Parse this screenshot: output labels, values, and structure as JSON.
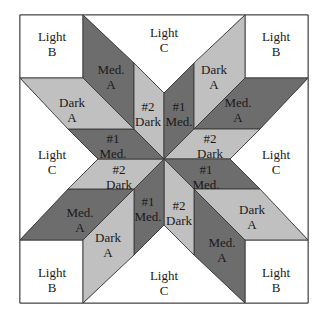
{
  "colors": {
    "light": "#ffffff",
    "medium": "#6d6d6d",
    "dark": "#c0c0c0",
    "outline": "#3a3a3a",
    "text": "#1a1a1a"
  },
  "corners": [
    {
      "id": "corner-top-left",
      "line1": "Light",
      "line2": "B"
    },
    {
      "id": "corner-top-right",
      "line1": "Light",
      "line2": "B"
    },
    {
      "id": "corner-bottom-left",
      "line1": "Light",
      "line2": "B"
    },
    {
      "id": "corner-bottom-right",
      "line1": "Light",
      "line2": "B"
    }
  ],
  "triangles": [
    {
      "id": "triangle-top",
      "line1": "Light",
      "line2": "C"
    },
    {
      "id": "triangle-right",
      "line1": "Light",
      "line2": "C"
    },
    {
      "id": "triangle-bottom",
      "line1": "Light",
      "line2": "C"
    },
    {
      "id": "triangle-left",
      "line1": "Light",
      "line2": "C"
    }
  ],
  "pieces": [
    {
      "id": "outer-top-left",
      "tone": "medium",
      "line1": "Med.",
      "line2": "A"
    },
    {
      "id": "inner-top-left",
      "tone": "dark",
      "line1": "#2",
      "line2": "Dark"
    },
    {
      "id": "inner-top-right",
      "tone": "medium",
      "line1": "#1",
      "line2": "Med."
    },
    {
      "id": "outer-top-right",
      "tone": "dark",
      "line1": "Dark",
      "line2": "A"
    },
    {
      "id": "outer-right-upper",
      "tone": "medium",
      "line1": "Med.",
      "line2": "A"
    },
    {
      "id": "inner-right-upper",
      "tone": "dark",
      "line1": "#2",
      "line2": "Dark"
    },
    {
      "id": "inner-right-lower",
      "tone": "medium",
      "line1": "#1",
      "line2": "Med."
    },
    {
      "id": "outer-right-lower",
      "tone": "dark",
      "line1": "Dark",
      "line2": "A"
    },
    {
      "id": "outer-bottom-right",
      "tone": "medium",
      "line1": "Med.",
      "line2": "A"
    },
    {
      "id": "inner-bottom-right",
      "tone": "dark",
      "line1": "#2",
      "line2": "Dark"
    },
    {
      "id": "inner-bottom-left",
      "tone": "medium",
      "line1": "#1",
      "line2": "Med."
    },
    {
      "id": "outer-bottom-left",
      "tone": "dark",
      "line1": "Dark",
      "line2": "A"
    },
    {
      "id": "outer-left-lower",
      "tone": "medium",
      "line1": "Med.",
      "line2": "A"
    },
    {
      "id": "inner-left-lower",
      "tone": "dark",
      "line1": "#2",
      "line2": "Dark"
    },
    {
      "id": "inner-left-upper",
      "tone": "medium",
      "line1": "#1",
      "line2": "Med."
    },
    {
      "id": "outer-left-upper",
      "tone": "dark",
      "line1": "Dark",
      "line2": "A"
    }
  ]
}
